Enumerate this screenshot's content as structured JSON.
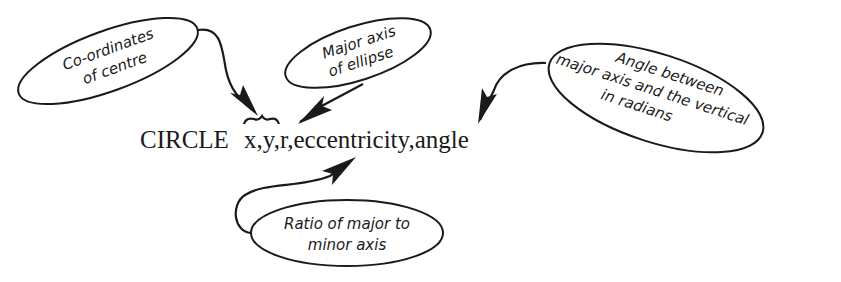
{
  "diagram": {
    "statement": {
      "keyword": "CIRCLE",
      "arguments": "x,y,r,eccentricity,angle"
    },
    "callouts": [
      {
        "id": "centre",
        "lines": [
          "Co-ordinates",
          "of centre"
        ],
        "points_to": "x,y"
      },
      {
        "id": "major-axis",
        "lines": [
          "Major axis",
          "of ellipse"
        ],
        "points_to": "r"
      },
      {
        "id": "angle",
        "lines": [
          "Angle between",
          "major axis and the vertical",
          "in radians"
        ],
        "points_to": "angle"
      },
      {
        "id": "ratio",
        "lines": [
          "Ratio of major to",
          "minor axis"
        ],
        "points_to": "eccentricity"
      }
    ]
  }
}
